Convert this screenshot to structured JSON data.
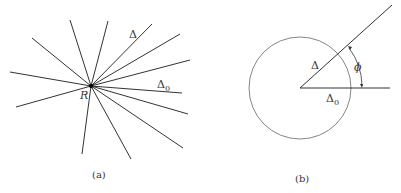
{
  "panels": [
    {
      "id": "a",
      "caption": "(a)",
      "center_label": "R",
      "labels": {
        "delta": "Δ",
        "delta0": "Δ",
        "delta0_sub": "0"
      },
      "center": [
        91,
        86
      ],
      "line_endpoints": [
        [
          70,
          20
        ],
        [
          108,
          21
        ],
        [
          32,
          38
        ],
        [
          152,
          24
        ],
        [
          180,
          34
        ],
        [
          190,
          60
        ],
        [
          10,
          72
        ],
        [
          182,
          93
        ],
        [
          16,
          107
        ],
        [
          188,
          114
        ],
        [
          82,
          154
        ],
        [
          183,
          148
        ],
        [
          131,
          159
        ]
      ]
    },
    {
      "id": "b",
      "caption": "(b)",
      "labels": {
        "delta": "Δ",
        "delta0": "Δ",
        "delta0_sub": "0",
        "angle": "ϕ"
      },
      "circle": {
        "cx": 300,
        "cy": 88,
        "r": 51
      },
      "delta_end": [
        392,
        5
      ],
      "delta0_end": [
        390,
        88
      ]
    }
  ]
}
